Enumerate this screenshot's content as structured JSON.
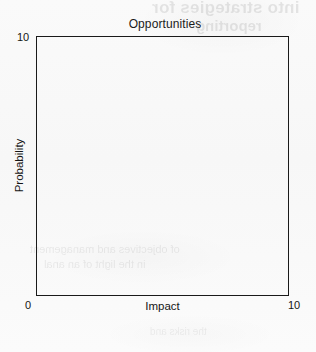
{
  "chart_data": {
    "type": "scatter",
    "title": "Opportunities",
    "xlabel": "Impact",
    "ylabel": "Probability",
    "xlim": [
      0,
      10
    ],
    "ylim": [
      0,
      10
    ],
    "x_tick_labels": [
      "0",
      "10"
    ],
    "y_tick_labels": [
      "10"
    ],
    "grid": false,
    "legend": null,
    "series": [],
    "x": [],
    "y": [],
    "annotations": []
  },
  "chart": {
    "title": "Opportunities",
    "x_axis": {
      "label": "Impact",
      "min_label": "0",
      "max_label": "10"
    },
    "y_axis": {
      "label": "Probability",
      "max_label": "10"
    }
  },
  "background_showthrough": {
    "line1": "into strategies for ",
    "line2": "reporting",
    "line3": "of objectives and management",
    "line4": "in the light of an anal",
    "line5": "the risks and"
  },
  "colors": {
    "axis": "#1a1a1a",
    "text": "#151515",
    "paper": "#f9f9f9"
  }
}
